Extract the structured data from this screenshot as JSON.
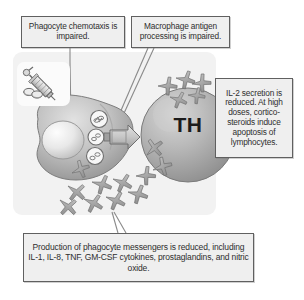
{
  "figure": {
    "panel_color": "#f2f2f2",
    "callout_fill": "#efefef",
    "callout_border": "#606060"
  },
  "callouts": [
    {
      "id": "chemotaxis",
      "name": "callout-phagocyte-chemotaxis",
      "text": "Phagocyte chemotaxis is impaired."
    },
    {
      "id": "antigen",
      "name": "callout-macrophage-antigen",
      "text": "Macrophage antigen processing is impaired."
    },
    {
      "id": "il2",
      "name": "callout-il2-secretion",
      "text": "IL-2 secretion is reduced. At high doses, cortico-steroids induce apoptosis of lymphocytes."
    },
    {
      "id": "messengers",
      "name": "callout-phagocyte-messengers",
      "text": "Production of phagocyte messengers is reduced, including IL-1, IL-8, TNF, GM-CSF cytokines, prostaglandins, and nitric oxide."
    }
  ],
  "cells": {
    "macrophage": {
      "label": "",
      "icon": "macrophage-cell",
      "fill": "#b9b9b9"
    },
    "t_helper": {
      "label": "TH",
      "icon": "t-helper-cell",
      "fill": "#adadad"
    }
  },
  "icons": {
    "drug": "syringe-and-pills-icon",
    "cytokine": "cytokine-molecule-icon",
    "signal_arrow": "signal-arrow-icon",
    "mhc_receptor": "mhc-receptor-icon"
  },
  "legend_colors": {
    "cell_gray": "#b0b0b0",
    "cytokine_gray": "#9a9a9a",
    "outline": "#5f5f5f"
  }
}
